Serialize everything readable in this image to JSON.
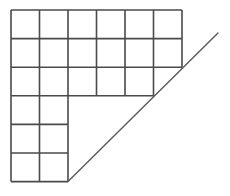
{
  "figure": {
    "type": "geometric-diagram",
    "background_color": "#ffffff",
    "line_color": "#4a4a4a",
    "diagonal_color": "#5a5a5a",
    "cell_fill": "#ffffff",
    "grid_stroke_width": 1.6,
    "diagonal_stroke_width": 1.4,
    "geometry": {
      "origin_x": 11,
      "origin_y": 10,
      "cell_width": 28.5,
      "cell_height": 28.6,
      "columns": 6,
      "rows": 6,
      "column_x": [
        11,
        39.5,
        68,
        96.5,
        125,
        153.5,
        182
      ],
      "row_y": [
        10,
        38.6,
        67.2,
        95.8,
        124.4,
        153,
        181.6
      ]
    },
    "rows": [
      {
        "index": 1,
        "cells": 6,
        "label": "row-1"
      },
      {
        "index": 2,
        "cells": 6,
        "label": "row-2"
      },
      {
        "index": 3,
        "cells": 5,
        "label": "row-3"
      },
      {
        "index": 4,
        "cells": 2,
        "label": "row-4"
      },
      {
        "index": 5,
        "cells": 2,
        "label": "row-5"
      },
      {
        "index": 6,
        "cells": 2,
        "label": "row-6"
      }
    ],
    "total_cells": 23,
    "diagonal": {
      "x1": 68,
      "y1": 181.6,
      "x2": 218,
      "y2": 33,
      "label": "diagonal-line"
    }
  },
  "chart_data": {
    "type": "table",
    "xlabel": "",
    "ylabel": "",
    "categories": [
      "row-1",
      "row-2",
      "row-3",
      "row-4",
      "row-5",
      "row-6"
    ],
    "values": [
      6,
      6,
      5,
      2,
      2,
      2
    ]
  }
}
